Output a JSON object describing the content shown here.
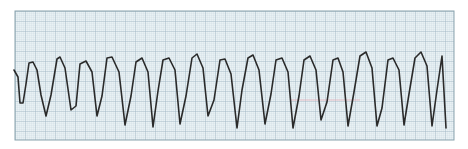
{
  "chart_data": {
    "type": "line",
    "title": "",
    "xlabel": "",
    "ylabel": "",
    "grid": true,
    "grid_minor_px": 2,
    "grid_major_px": 10,
    "colors": {
      "background": "#e9f1f4",
      "grid_minor": "#c6d6de",
      "grid_major": "#9db4c0",
      "border": "#8aa3ae",
      "trace": "#2a2a2a",
      "marker_line": "#e8b4bc"
    },
    "strip_box": {
      "x": 15,
      "y": 11,
      "width": 439,
      "height": 129
    },
    "complex_count": 20,
    "x": [
      14,
      18,
      20,
      23,
      26,
      29,
      33,
      37,
      41,
      46,
      51,
      57,
      60,
      65,
      71,
      76,
      80,
      86,
      92,
      97,
      102,
      107,
      112,
      119,
      125,
      131,
      136,
      142,
      148,
      153,
      158,
      163,
      169,
      175,
      180,
      186,
      192,
      197,
      203,
      208,
      214,
      220,
      225,
      231,
      237,
      242,
      248,
      253,
      259,
      265,
      271,
      276,
      282,
      288,
      293,
      299,
      304,
      310,
      316,
      321,
      327,
      333,
      338,
      343,
      348,
      354,
      360,
      366,
      372,
      377,
      382,
      388,
      393,
      399,
      404,
      409,
      415,
      421,
      427,
      432,
      437,
      442,
      446
    ],
    "y": [
      70,
      77,
      103,
      103,
      84,
      63,
      62,
      70,
      95,
      116,
      95,
      59,
      57,
      68,
      110,
      106,
      64,
      61,
      72,
      116,
      96,
      58,
      57,
      72,
      125,
      96,
      62,
      58,
      72,
      127,
      91,
      60,
      58,
      70,
      124,
      96,
      58,
      54,
      68,
      116,
      100,
      60,
      59,
      74,
      128,
      90,
      58,
      55,
      70,
      124,
      94,
      60,
      58,
      72,
      128,
      96,
      60,
      56,
      70,
      120,
      102,
      60,
      58,
      72,
      126,
      92,
      56,
      52,
      68,
      126,
      108,
      60,
      58,
      70,
      125,
      94,
      58,
      52,
      66,
      126,
      90,
      56,
      128
    ]
  },
  "annotations": {
    "marker_line": {
      "x1": 290,
      "x2": 360,
      "y": 100
    }
  }
}
